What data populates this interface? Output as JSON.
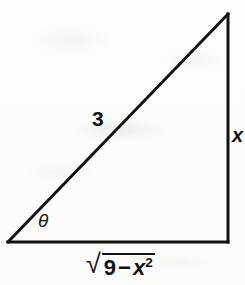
{
  "figure": {
    "kind": "right-triangle-diagram",
    "background_color": "#fdfdfc",
    "stroke_color": "#111111",
    "stroke_width": 3,
    "vertices": {
      "bottom_left": [
        8,
        242
      ],
      "bottom_right": [
        228,
        242
      ],
      "top_right": [
        228,
        14
      ]
    }
  },
  "labels": {
    "hypotenuse": "3",
    "opposite_leg": "x",
    "angle": "θ",
    "adjacent_leg": {
      "radical_sign": "√",
      "radicand_first": "9",
      "operator": "−",
      "radicand_variable": "x",
      "radicand_exponent": "2",
      "full_text": "√(9 − x²)"
    }
  }
}
